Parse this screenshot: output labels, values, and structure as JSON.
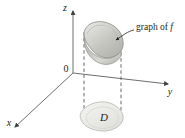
{
  "figure": {
    "background_color": "#ffffff",
    "axes": {
      "z_label": "z",
      "y_label": "y",
      "x_label": "x",
      "origin_label": "0",
      "axis_color": "#6d6e71"
    },
    "annotations": {
      "graph_label_prefix": "graph of ",
      "graph_label_symbol": "f",
      "region_label": "D"
    },
    "colors": {
      "surface_fill_light": "#e8e8e6",
      "surface_fill_mid": "#c9c9c5",
      "surface_fill_dark": "#a9a9a4",
      "surface_stroke": "#8c8c88",
      "region_fill": "#eeeeec",
      "region_stroke": "#b8b8b4",
      "dashed_line": "#58595b",
      "text": "#231f20"
    }
  }
}
